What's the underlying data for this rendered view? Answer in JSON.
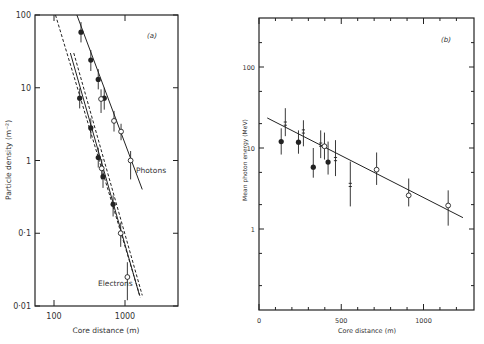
{
  "chart_data": [
    {
      "type": "scatter",
      "panel_label": "(a)",
      "title": "",
      "xlabel": "Core distance (m)",
      "ylabel": "Particle density (m⁻²)",
      "xscale": "log",
      "yscale": "log",
      "xlim": [
        50,
        2500
      ],
      "ylim": [
        0.01,
        100
      ],
      "x_ticks": [
        100,
        1000
      ],
      "x_tick_labels": [
        "100",
        "1000"
      ],
      "y_ticks": [
        0.01,
        0.1,
        1,
        10,
        100
      ],
      "y_tick_labels": [
        "0·01",
        "0·1",
        "1",
        "10",
        "100"
      ],
      "grid": false,
      "annotations": [
        "Photons",
        "Electrons"
      ],
      "series": [
        {
          "name": "Photons (filled)",
          "marker": "filled-circle",
          "points": [
            {
              "x": 240,
              "y": 58,
              "err": [
                42,
                80
              ]
            },
            {
              "x": 330,
              "y": 24,
              "err": [
                17,
                33
              ]
            },
            {
              "x": 420,
              "y": 13,
              "err": [
                9.5,
                18
              ]
            },
            {
              "x": 510,
              "y": 7.2,
              "err": [
                5,
                10
              ]
            }
          ]
        },
        {
          "name": "Photons (open)",
          "marker": "open-circle",
          "points": [
            {
              "x": 460,
              "y": 7.0,
              "err": [
                4.5,
                9.5
              ]
            },
            {
              "x": 700,
              "y": 3.5,
              "err": [
                2.5,
                4.8
              ]
            },
            {
              "x": 880,
              "y": 2.5,
              "err": [
                1.9,
                3.2
              ]
            },
            {
              "x": 1200,
              "y": 1.0,
              "err": [
                0.55,
                1.35
              ]
            }
          ]
        },
        {
          "name": "Electrons (filled)",
          "marker": "filled-circle",
          "points": [
            {
              "x": 230,
              "y": 7.2,
              "err": [
                5.2,
                9.8
              ]
            },
            {
              "x": 330,
              "y": 2.8,
              "err": [
                2.0,
                3.8
              ]
            },
            {
              "x": 420,
              "y": 1.1,
              "err": [
                0.8,
                1.5
              ]
            },
            {
              "x": 490,
              "y": 0.6,
              "err": [
                0.42,
                0.8
              ]
            },
            {
              "x": 680,
              "y": 0.25,
              "err": [
                0.17,
                0.33
              ]
            }
          ]
        },
        {
          "name": "Electrons (open)",
          "marker": "open-circle",
          "points": [
            {
              "x": 470,
              "y": 0.78,
              "err": [
                0.55,
                1.05
              ]
            },
            {
              "x": 870,
              "y": 0.1,
              "err": [
                0.065,
                0.14
              ]
            },
            {
              "x": 1080,
              "y": 0.025,
              "err": [
                0.012,
                0.04
              ]
            }
          ]
        }
      ],
      "fits": [
        {
          "name": "Photons fit",
          "style": "solid",
          "from": {
            "x": 210,
            "y": 100
          },
          "to": {
            "x": 1750,
            "y": 0.4
          }
        },
        {
          "name": "Electrons fit",
          "style": "solid",
          "from": {
            "x": 170,
            "y": 30
          },
          "to": {
            "x": 1600,
            "y": 0.014
          }
        },
        {
          "name": "Electrons fit (dashed 1)",
          "style": "dashed",
          "from": {
            "x": 105,
            "y": 100
          },
          "to": {
            "x": 1650,
            "y": 0.013
          }
        },
        {
          "name": "Electrons fit (dashed 2)",
          "style": "dashed",
          "from": {
            "x": 190,
            "y": 30
          },
          "to": {
            "x": 1750,
            "y": 0.014
          }
        }
      ]
    },
    {
      "type": "scatter",
      "panel_label": "(b)",
      "title": "",
      "xlabel": "Core distance (m)",
      "ylabel": "Mean photon energy (MeV)",
      "xscale": "linear",
      "yscale": "log",
      "xlim": [
        0,
        1300
      ],
      "ylim": [
        0.13,
        550
      ],
      "x_ticks": [
        0,
        500,
        1000
      ],
      "x_tick_labels": [
        "0",
        "500",
        "1000"
      ],
      "y_ticks": [
        1,
        10,
        100
      ],
      "y_tick_labels": [
        "1",
        "10",
        "100"
      ],
      "grid": false,
      "series": [
        {
          "name": "Filled circles",
          "marker": "filled-circle",
          "points": [
            {
              "x": 135,
              "y": 12,
              "err": [
                8.3,
                17.5
              ]
            },
            {
              "x": 240,
              "y": 11.8,
              "err": [
                8.5,
                16.5
              ]
            },
            {
              "x": 330,
              "y": 5.8,
              "err": [
                4.3,
                10
              ]
            },
            {
              "x": 420,
              "y": 6.7,
              "err": [
                4.7,
                12
              ]
            }
          ]
        },
        {
          "name": "Crosses",
          "marker": "cross",
          "points": [
            {
              "x": 160,
              "y": 20,
              "err": [
                14,
                31
              ]
            },
            {
              "x": 270,
              "y": 16,
              "err": [
                10.5,
                22
              ]
            },
            {
              "x": 375,
              "y": 11,
              "err": [
                7.5,
                16.5
              ]
            },
            {
              "x": 465,
              "y": 7.3,
              "err": [
                4.5,
                12.5
              ]
            },
            {
              "x": 555,
              "y": 3.5,
              "err": [
                1.9,
                6.8
              ]
            }
          ]
        },
        {
          "name": "Open circles",
          "marker": "open-circle",
          "points": [
            {
              "x": 398,
              "y": 10.5,
              "err": [
                7.2,
                15.5
              ]
            },
            {
              "x": 715,
              "y": 5.4,
              "err": [
                3.5,
                8.8
              ]
            },
            {
              "x": 910,
              "y": 2.6,
              "err": [
                1.9,
                4.2
              ]
            },
            {
              "x": 1150,
              "y": 1.95,
              "err": [
                1.1,
                3.0
              ]
            }
          ]
        }
      ],
      "fits": [
        {
          "name": "Fit line",
          "style": "solid",
          "from": {
            "x": 50,
            "y": 23.5
          },
          "to": {
            "x": 1240,
            "y": 1.38
          }
        }
      ]
    }
  ]
}
